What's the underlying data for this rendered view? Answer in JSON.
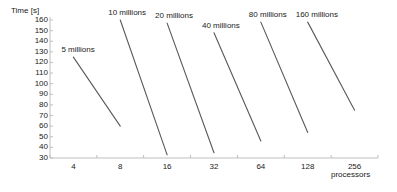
{
  "chart_data": {
    "type": "line",
    "title": "",
    "xlabel": "processors",
    "ylabel": "Time [s]",
    "x_tick_labels": [
      "4",
      "8",
      "16",
      "32",
      "64",
      "128",
      "256"
    ],
    "x_scale": "log2",
    "xlim": [
      2.83,
      362
    ],
    "y_tick_labels": [
      "160",
      "150",
      "140",
      "130",
      "120",
      "110",
      "100",
      "90",
      "80",
      "70",
      "60",
      "50",
      "40",
      "30"
    ],
    "ylim": [
      30,
      160
    ],
    "grid": false,
    "legend_position": "inline-above-each-line",
    "series": [
      {
        "name": "5 millions",
        "label": "5 millions",
        "x": [
          4,
          8
        ],
        "y": [
          125,
          60
        ]
      },
      {
        "name": "10 millions",
        "label": "10 millions",
        "x": [
          8,
          16
        ],
        "y": [
          160,
          33
        ]
      },
      {
        "name": "20 millions",
        "label": "20 millions",
        "x": [
          16,
          32
        ],
        "y": [
          157,
          35
        ]
      },
      {
        "name": "40 millions",
        "label": "40 millions",
        "x": [
          32,
          64
        ],
        "y": [
          148,
          46
        ]
      },
      {
        "name": "80 millions",
        "label": "80 millions",
        "x": [
          64,
          128
        ],
        "y": [
          158,
          54
        ]
      },
      {
        "name": "160 millions",
        "label": "160 millions",
        "x": [
          128,
          256
        ],
        "y": [
          158,
          75
        ]
      }
    ]
  },
  "axes": {
    "y_title": "Time [s]",
    "x_title": "processors"
  },
  "colors": {
    "line": "#595959",
    "axis": "#bfbfbf",
    "text": "#1a1a1a",
    "background": "#ffffff"
  }
}
